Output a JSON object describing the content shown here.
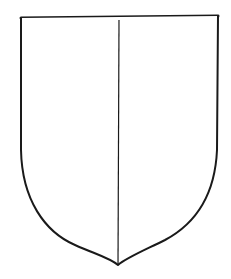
{
  "figure": {
    "stroke_color": "#1a1a1a",
    "fill_color": "#ffffff",
    "background": "#ffffff"
  }
}
